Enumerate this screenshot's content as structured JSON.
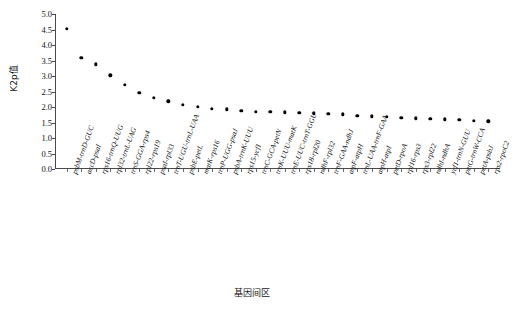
{
  "chart_data": {
    "type": "scatter",
    "title": "",
    "xlabel": "基因间区",
    "ylabel": "K2p值",
    "ylim": [
      0.0,
      5.0
    ],
    "grid": false,
    "legend": false,
    "yticks": [
      "0.0",
      "0.5",
      "1.0",
      "1.5",
      "2.0",
      "2.5",
      "3.0",
      "3.5",
      "4.0",
      "4.5",
      "5.0"
    ],
    "ytick_values": [
      0.0,
      0.5,
      1.0,
      1.5,
      2.0,
      2.5,
      3.0,
      3.5,
      4.0,
      4.5,
      5.0
    ],
    "categories": [
      "psbM-trnD-GUC",
      "accD-psaI",
      "rps16-trnQ-UUG",
      "rpl32-trnL-UAG",
      "trnS-GGA-rps4",
      "rpl22-rps19",
      "psaI-rpl33",
      "trnT-UGU-trnL-UAA",
      "psbE-petL",
      "matK-rps16",
      "trnP-UGG-psaJ",
      "psbA-trnK-UUU",
      "rps15-ycf1",
      "trnC-GCA-petN",
      "trnK-UUU-matK",
      "trnE-UUC-trnT-GGU",
      "rps18-rpl20",
      "ndhF-rpl32",
      "trnF-GAA-ndhJ",
      "atpF-atpH",
      "trnL-UAA-trnF-GAA",
      "atpH-atpI",
      "petD-rpoA",
      "rpl16-rps3",
      "rps3-rpl22",
      "ndhI-ndhA",
      "ycf1-trnN-GUU",
      "petG-trnW-CCA",
      "petA-psbJ",
      "rps2-rpoC2"
    ],
    "values": [
      4.53,
      3.58,
      3.38,
      3.02,
      2.71,
      2.45,
      2.3,
      2.18,
      2.08,
      2.0,
      1.95,
      1.93,
      1.88,
      1.85,
      1.84,
      1.83,
      1.82,
      1.8,
      1.78,
      1.77,
      1.72,
      1.7,
      1.68,
      1.66,
      1.64,
      1.62,
      1.6,
      1.58,
      1.56,
      1.54
    ],
    "marker": "circle",
    "marker_color": "#000000",
    "axis_color": "#4a4a4a"
  }
}
